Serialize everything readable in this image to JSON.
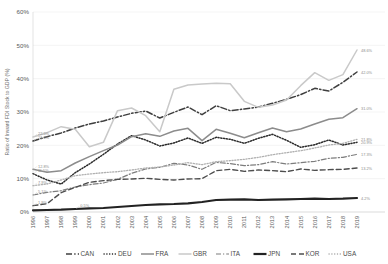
{
  "chart_data": {
    "type": "line",
    "title": "",
    "xlabel": "",
    "ylabel": "Ratio of Inward FDI Stock to GDP (%)",
    "ylim": [
      0,
      60
    ],
    "ytick_labels": [
      "0%",
      "10%",
      "20%",
      "30%",
      "40%",
      "50%",
      "60%"
    ],
    "ytick_values": [
      0,
      10,
      20,
      30,
      40,
      50,
      60
    ],
    "grid": true,
    "legend_position": "bottom",
    "x": [
      1996,
      1997,
      1998,
      1999,
      2000,
      2001,
      2002,
      2003,
      2004,
      2005,
      2006,
      2007,
      2008,
      2009,
      2010,
      2011,
      2012,
      2013,
      2014,
      2015,
      2016,
      2017,
      2018,
      2019
    ],
    "categories": [
      "1996",
      "1997",
      "1998",
      "1999",
      "2000",
      "2001",
      "2002",
      "2003",
      "2004",
      "2005",
      "2006",
      "2007",
      "2008",
      "2009",
      "2010",
      "2011",
      "2012",
      "2013",
      "2014",
      "2015",
      "2016",
      "2017",
      "2018",
      "2019"
    ],
    "series": [
      {
        "name": "CAN",
        "style": "dash-dot",
        "color": "#3f3f3f",
        "start_label": "21.3%",
        "end_label": "42.0%",
        "values": [
          21.3,
          22.6,
          23.7,
          25.2,
          26.4,
          27.3,
          28.5,
          29.6,
          30.3,
          28.2,
          29.9,
          31.5,
          29.2,
          31.9,
          30.4,
          30.9,
          31.5,
          32.6,
          33.8,
          35.2,
          37.1,
          36.3,
          38.9,
          42.0
        ]
      },
      {
        "name": "DEU",
        "style": "dotted",
        "color": "#2b2b2b",
        "start_label": "11.5%",
        "end_label": "20.9%",
        "values": [
          11.5,
          9.6,
          8.4,
          11.8,
          14.4,
          17.3,
          20.4,
          22.9,
          21.6,
          19.8,
          20.7,
          22.2,
          20.6,
          22.4,
          21.8,
          20.6,
          22.1,
          23.3,
          21.5,
          19.4,
          20.2,
          21.6,
          20.1,
          20.9
        ]
      },
      {
        "name": "FRA",
        "style": "solid",
        "color": "#8c8c8c",
        "start_label": "12.8%",
        "end_label": "31.0%",
        "values": [
          12.8,
          11.9,
          12.4,
          14.7,
          16.6,
          18.4,
          20.1,
          22.6,
          23.5,
          22.7,
          24.3,
          25.1,
          21.4,
          24.8,
          23.6,
          22.3,
          23.8,
          25.2,
          24.1,
          24.9,
          26.4,
          27.8,
          28.3,
          31.0
        ]
      },
      {
        "name": "GBR",
        "style": "solid-light",
        "color": "#c9c9c9",
        "start_label": "22.5%",
        "end_label": "48.6%",
        "values": [
          22.5,
          23.8,
          25.6,
          24.8,
          19.6,
          20.9,
          30.4,
          31.2,
          28.9,
          24.1,
          36.8,
          38.1,
          38.4,
          38.6,
          38.5,
          33.2,
          31.4,
          32.1,
          33.6,
          37.9,
          41.8,
          39.5,
          41.2,
          48.6
        ]
      },
      {
        "name": "ITA",
        "style": "dash-dot-thin",
        "color": "#7d7d7d",
        "start_label": "5.1%",
        "end_label": "17.3%",
        "values": [
          5.1,
          5.9,
          6.4,
          7.5,
          8.2,
          8.7,
          9.8,
          11.6,
          12.9,
          13.4,
          14.6,
          14.1,
          12.8,
          14.9,
          14.5,
          13.9,
          14.2,
          15.1,
          14.4,
          14.8,
          15.2,
          16.1,
          16.4,
          17.3
        ]
      },
      {
        "name": "JPN",
        "style": "solid-thick",
        "color": "#222222",
        "start_label": "0.5%",
        "end_label": "4.2%",
        "values": [
          0.5,
          0.6,
          0.7,
          0.9,
          1.1,
          1.2,
          1.5,
          1.8,
          2.1,
          2.3,
          2.4,
          2.6,
          3.0,
          3.6,
          3.7,
          3.8,
          3.6,
          3.7,
          3.8,
          3.9,
          4.0,
          3.9,
          4.0,
          4.2
        ]
      },
      {
        "name": "KOR",
        "style": "dashed",
        "color": "#4d4d4d",
        "start_label": "1.9%",
        "end_label": "13.2%",
        "values": [
          1.9,
          2.5,
          5.8,
          7.4,
          8.9,
          9.4,
          9.8,
          9.9,
          10.1,
          9.8,
          9.6,
          9.9,
          10.0,
          12.4,
          12.8,
          12.2,
          12.6,
          12.4,
          12.1,
          12.9,
          12.5,
          12.7,
          12.8,
          13.2
        ]
      },
      {
        "name": "USA",
        "style": "dotted-light",
        "color": "#b0b0b0",
        "start_label": "7.9%",
        "end_label": "21.8%",
        "values": [
          7.9,
          8.4,
          9.6,
          10.9,
          11.4,
          11.8,
          12.1,
          12.6,
          13.2,
          13.5,
          14.1,
          14.8,
          14.2,
          15.1,
          15.4,
          15.8,
          16.4,
          17.2,
          17.8,
          18.4,
          19.2,
          20.1,
          20.6,
          21.8
        ]
      }
    ],
    "annotations": [
      {
        "text": "22.5%",
        "series": "GBR",
        "x": 1996
      },
      {
        "text": "21.3%",
        "series": "CAN",
        "x": 1996
      },
      {
        "text": "11.5%",
        "series": "DEU",
        "x": 1996
      },
      {
        "text": "12.8%",
        "series": "FRA",
        "x": 1996
      },
      {
        "text": "7.9%",
        "series": "USA",
        "x": 1996
      },
      {
        "text": "5.1%",
        "series": "ITA",
        "x": 1996
      },
      {
        "text": "1.9%",
        "series": "KOR",
        "x": 1996
      },
      {
        "text": "0.5%",
        "series": "JPN",
        "x": 1999
      },
      {
        "text": "48.6%",
        "series": "GBR",
        "x": 2019
      },
      {
        "text": "42.0%",
        "series": "CAN",
        "x": 2019
      },
      {
        "text": "31.0%",
        "series": "FRA",
        "x": 2019
      },
      {
        "text": "21.8%",
        "series": "USA",
        "x": 2019
      },
      {
        "text": "20.9%",
        "series": "DEU",
        "x": 2019
      },
      {
        "text": "17.3%",
        "series": "ITA",
        "x": 2019
      },
      {
        "text": "13.2%",
        "series": "KOR",
        "x": 2019
      },
      {
        "text": "4.2%",
        "series": "JPN",
        "x": 2019
      }
    ]
  },
  "legend": {
    "items": [
      {
        "label": "CAN"
      },
      {
        "label": "DEU"
      },
      {
        "label": "FRA"
      },
      {
        "label": "GBR"
      },
      {
        "label": "ITA"
      },
      {
        "label": "JPN"
      },
      {
        "label": "KOR"
      },
      {
        "label": "USA"
      }
    ]
  }
}
